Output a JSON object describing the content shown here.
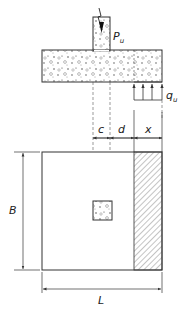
{
  "diagram": {
    "labels": {
      "load": "P",
      "load_sub": "u",
      "pressure": "q",
      "pressure_sub": "u",
      "dim_c": "c",
      "dim_d": "d",
      "dim_x": "x",
      "dim_B": "B",
      "dim_L": "L"
    },
    "colors": {
      "stroke": "#333333",
      "hatch": "#555555",
      "background": "#ffffff"
    }
  }
}
